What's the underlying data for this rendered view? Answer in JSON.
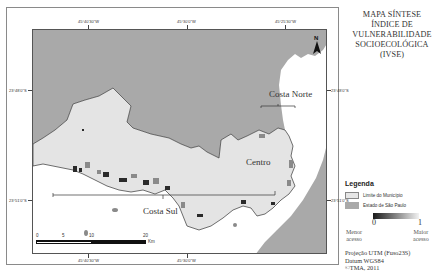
{
  "title": {
    "lines": [
      "MAPA SÍNTESE",
      "ÍNDICE DE",
      "VULNERABILIDADE",
      "SOCIOECOLÓGICA",
      "(IVSE)"
    ]
  },
  "grid": {
    "top_longitudes": [
      "45°40'30\"W",
      "45°30'0\"W",
      "45°25'30\"W"
    ],
    "bottom_longitudes": [
      "45°40'30\"W",
      "45°30'0\"W"
    ],
    "left_latitudes": [
      "23°48'0\"S",
      "23°51'0\"S"
    ],
    "right_latitudes": [
      "23°48'0\"S",
      "23°51'0\"S"
    ]
  },
  "places": {
    "costa_norte": "Costa Norte",
    "centro": "Centro",
    "costa_sul": "Costa Sul"
  },
  "north_arrow": {
    "label": "N"
  },
  "scale_bar": {
    "ticks": [
      "0",
      "5",
      "10",
      "20"
    ],
    "unit": "Km"
  },
  "legend": {
    "title": "Legenda",
    "items": [
      {
        "label": "Limite do Município",
        "color": "#e6e6e6"
      },
      {
        "label": "Estado de São Paulo",
        "color": "#a9a9a9"
      }
    ],
    "gradient": {
      "min": "0",
      "max": "1",
      "min_label": [
        "Menor",
        "acesso"
      ],
      "max_label": [
        "Maior",
        "acesso"
      ]
    }
  },
  "credits": [
    "Projeção UTM (Fuso23S)",
    "Datum WGS84",
    "©TMA, 2011"
  ],
  "colors": {
    "state_gray": "#a9a9a9",
    "municipality": "#e4e4e4",
    "ocean": "#ffffff",
    "high_vulnerability": "#2a2a2a"
  }
}
